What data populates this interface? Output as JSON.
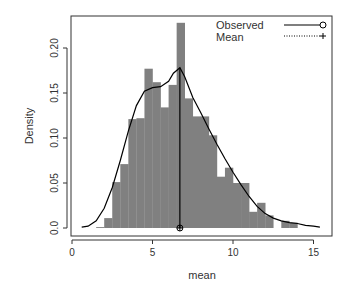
{
  "chart_data": {
    "type": "bar",
    "subtype": "histogram_with_density",
    "title": "",
    "xlabel": "mean",
    "ylabel": "Density",
    "xlim": [
      -0.1,
      16.2
    ],
    "ylim": [
      0,
      0.235
    ],
    "grid": false,
    "legend_position": "top-right",
    "x_ticks": [
      0,
      5,
      10,
      15
    ],
    "x_tick_labels": [
      "0",
      "5",
      "10",
      "15"
    ],
    "y_ticks": [
      0.0,
      0.05,
      0.1,
      0.15,
      0.2
    ],
    "y_tick_labels": [
      "0.0",
      "0.05",
      "0.10",
      "0.15",
      "0.20"
    ],
    "bin_width": 0.5,
    "bins": [
      {
        "x0": 1.5,
        "x1": 2.0,
        "density": 0.001
      },
      {
        "x0": 2.0,
        "x1": 2.5,
        "density": 0.011
      },
      {
        "x0": 2.5,
        "x1": 3.0,
        "density": 0.051
      },
      {
        "x0": 3.0,
        "x1": 3.5,
        "density": 0.071
      },
      {
        "x0": 3.5,
        "x1": 4.0,
        "density": 0.121
      },
      {
        "x0": 4.0,
        "x1": 4.5,
        "density": 0.122
      },
      {
        "x0": 4.5,
        "x1": 5.0,
        "density": 0.177
      },
      {
        "x0": 5.0,
        "x1": 5.5,
        "density": 0.162
      },
      {
        "x0": 5.5,
        "x1": 6.0,
        "density": 0.134
      },
      {
        "x0": 6.0,
        "x1": 6.5,
        "density": 0.159
      },
      {
        "x0": 6.5,
        "x1": 7.0,
        "density": 0.228
      },
      {
        "x0": 7.0,
        "x1": 7.5,
        "density": 0.144
      },
      {
        "x0": 7.5,
        "x1": 8.0,
        "density": 0.124
      },
      {
        "x0": 8.0,
        "x1": 8.5,
        "density": 0.124
      },
      {
        "x0": 8.5,
        "x1": 9.0,
        "density": 0.103
      },
      {
        "x0": 9.0,
        "x1": 9.5,
        "density": 0.057
      },
      {
        "x0": 9.5,
        "x1": 10.0,
        "density": 0.067
      },
      {
        "x0": 10.0,
        "x1": 10.5,
        "density": 0.05
      },
      {
        "x0": 10.5,
        "x1": 11.0,
        "density": 0.05
      },
      {
        "x0": 11.0,
        "x1": 11.5,
        "density": 0.018
      },
      {
        "x0": 11.5,
        "x1": 12.0,
        "density": 0.028
      },
      {
        "x0": 12.0,
        "x1": 12.5,
        "density": 0.014
      },
      {
        "x0": 12.5,
        "x1": 13.0,
        "density": 0.0
      },
      {
        "x0": 13.0,
        "x1": 13.5,
        "density": 0.008
      },
      {
        "x0": 13.5,
        "x1": 14.0,
        "density": 0.006
      }
    ],
    "series": [
      {
        "name": "Observed",
        "type": "line",
        "style": "solid",
        "marker": "circle",
        "x": [
          0.6,
          1.0,
          1.5,
          2.0,
          2.5,
          3.0,
          3.5,
          4.0,
          4.5,
          5.0,
          5.5,
          6.0,
          6.3,
          6.7,
          7.0,
          7.5,
          8.0,
          8.5,
          9.0,
          9.5,
          10.0,
          10.5,
          11.0,
          11.5,
          12.0,
          12.5,
          13.0,
          13.5,
          14.0,
          14.5,
          15.0,
          15.4
        ],
        "y": [
          0.001,
          0.002,
          0.008,
          0.022,
          0.045,
          0.075,
          0.108,
          0.136,
          0.152,
          0.156,
          0.157,
          0.163,
          0.172,
          0.178,
          0.168,
          0.145,
          0.128,
          0.11,
          0.093,
          0.077,
          0.062,
          0.048,
          0.035,
          0.024,
          0.016,
          0.011,
          0.008,
          0.006,
          0.005,
          0.003,
          0.002,
          0.001
        ]
      },
      {
        "name": "Mean",
        "type": "vline",
        "style": "dotted",
        "marker": "plus",
        "x": 6.7,
        "y_range": [
          0,
          0.178
        ]
      }
    ],
    "legend": [
      {
        "label": "Observed",
        "line": "solid",
        "marker": "circle"
      },
      {
        "label": "Mean",
        "line": "dotted",
        "marker": "plus"
      }
    ]
  },
  "colors": {
    "bar_fill": "#808080",
    "axis": "#333333",
    "line": "#000000",
    "background": "#ffffff"
  },
  "labels": {
    "xlabel": "mean",
    "ylabel": "Density",
    "legend_observed": "Observed",
    "legend_mean": "Mean"
  }
}
